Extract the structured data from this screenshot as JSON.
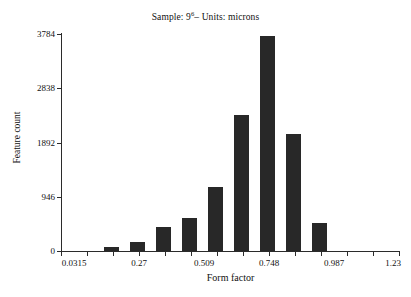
{
  "chart_data": {
    "type": "bar",
    "title_prefix": "Sample: 9",
    "title_superscript": "6",
    "title_suffix": "– Units: microns",
    "xlabel": "Form factor",
    "ylabel": "Feature count",
    "grid": false,
    "legend": null,
    "xlim": [
      0.0315,
      1.23
    ],
    "ylim": [
      0,
      3784
    ],
    "ytick_labels": [
      "0",
      "946",
      "1892",
      "2838",
      "3784"
    ],
    "ytick_values": [
      0,
      946,
      1892,
      2838,
      3784
    ],
    "xtick_labels": [
      "0.0315",
      "0.27",
      "0.509",
      "0.748",
      "0.987",
      "1.23"
    ],
    "xtick_values": [
      0.0315,
      0.27,
      0.509,
      0.748,
      0.987,
      1.23
    ],
    "bar_color": "#282828",
    "axis_color": "#2b2b2b",
    "categories": [
      "0.160",
      "0.210",
      "0.260",
      "0.310",
      "0.360",
      "0.410",
      "0.460",
      "0.510",
      "0.560"
    ],
    "x": [
      0.16,
      0.21,
      0.26,
      0.31,
      0.36,
      0.41,
      0.46,
      0.51,
      0.56
    ],
    "values": [
      70,
      160,
      420,
      575,
      1115,
      2370,
      3750,
      2040,
      490
    ]
  }
}
